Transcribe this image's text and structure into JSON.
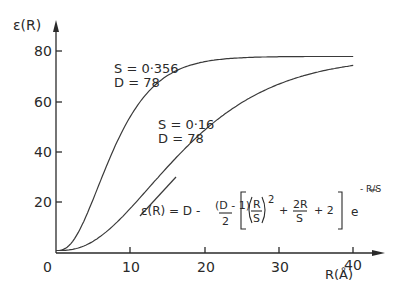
{
  "chart_data": {
    "type": "line",
    "title": "",
    "xlabel": "R(Å)",
    "ylabel": "ε(R)",
    "xlim": [
      0,
      42
    ],
    "ylim": [
      0,
      85
    ],
    "x_ticks": [
      "0",
      "10",
      "20",
      "30",
      "40"
    ],
    "y_ticks": [
      "20",
      "40",
      "60",
      "80"
    ],
    "grid": false,
    "legend": "inline annotations",
    "series": [
      {
        "name": "S = 0.356, D = 78",
        "S": 0.356,
        "D": 78,
        "x": [
          0,
          2,
          4,
          6,
          8,
          10,
          12,
          14,
          16,
          18,
          20,
          25,
          30,
          35,
          40
        ],
        "y": [
          1,
          3,
          11,
          24,
          39,
          54,
          63,
          69,
          73,
          75,
          76,
          77.5,
          78,
          78,
          78
        ]
      },
      {
        "name": "S = 0.16, D = 78",
        "S": 0.16,
        "D": 78,
        "x": [
          0,
          2,
          4,
          6,
          8,
          10,
          12,
          14,
          16,
          18,
          20,
          25,
          30,
          35,
          40
        ],
        "y": [
          1,
          1.5,
          3,
          6,
          11,
          16,
          22,
          29,
          35,
          41,
          46,
          58,
          66,
          70,
          73
        ]
      }
    ],
    "annotations": [
      {
        "text_line1": "S = 0·356",
        "text_line2": "D = 78"
      },
      {
        "text_line1": "S = 0·16",
        "text_line2": "D = 78"
      }
    ],
    "equation": {
      "lhs": "ε(R) = D -",
      "frac_num": "(D - 1)",
      "frac_den": "2",
      "r": "R",
      "s": "S",
      "sq": "2",
      "plus1": "+",
      "frac2_num": "2R",
      "frac2_den": "S",
      "plus2": "+ 2",
      "e": "e",
      "exp": "- R/S"
    }
  }
}
